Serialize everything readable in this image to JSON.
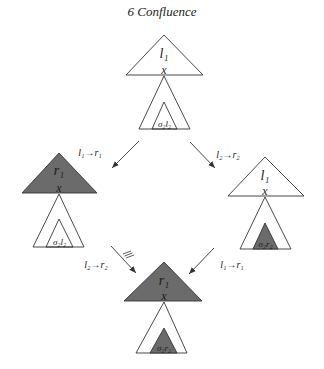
{
  "header": {
    "title": "6  Confluence"
  },
  "colors": {
    "fill": "#6b6b6b",
    "stroke": "#333333",
    "background": "#ffffff"
  },
  "trees": {
    "top": {
      "upper_label": "l₁",
      "joint_label": "x",
      "inner_label": "σ₂l₂",
      "upper_filled": false,
      "inner_filled": false
    },
    "left": {
      "upper_label": "r₁",
      "joint_label": "x",
      "inner_label": "σ₂l₂",
      "upper_filled": true,
      "inner_filled": false
    },
    "right": {
      "upper_label": "l₁",
      "joint_label": "x",
      "inner_label": "σ₂r₂",
      "upper_filled": false,
      "inner_filled": true
    },
    "bottom": {
      "upper_label": "r₁",
      "joint_label": "x",
      "inner_label": "σ₂r₂",
      "upper_filled": true,
      "inner_filled": true
    }
  },
  "arrows": {
    "top_left": {
      "label": "l₁→r₁"
    },
    "top_right": {
      "label": "l₂→r₂"
    },
    "bottom_left": {
      "label": "l₂→r₂",
      "mark": "≡"
    },
    "bottom_right": {
      "label": "l₁→r₁"
    }
  }
}
